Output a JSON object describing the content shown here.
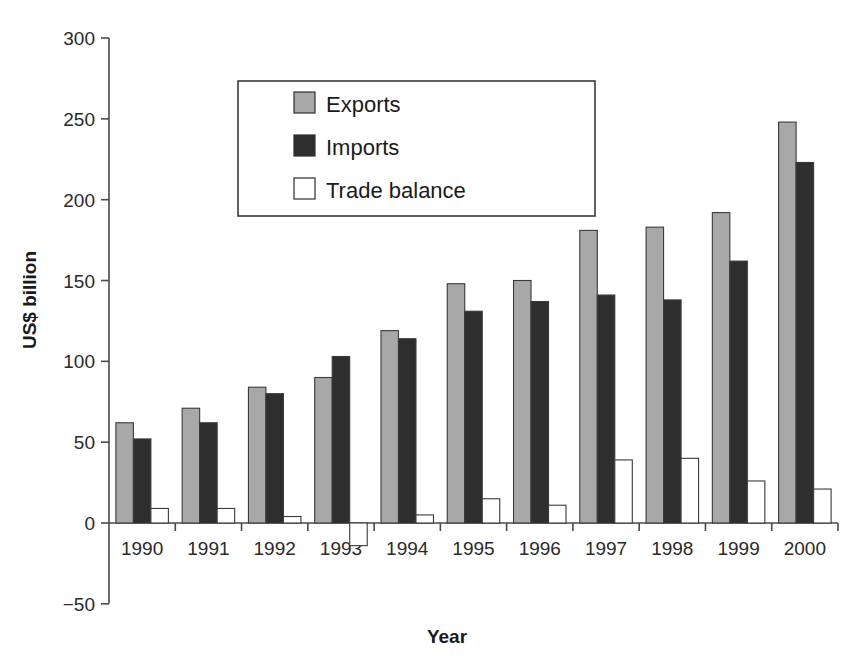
{
  "chart_data": {
    "type": "bar",
    "title": "",
    "xlabel": "Year",
    "ylabel": "US$ billion",
    "categories": [
      "1990",
      "1991",
      "1992",
      "1993",
      "1994",
      "1995",
      "1996",
      "1997",
      "1998",
      "1999",
      "2000"
    ],
    "series": [
      {
        "name": "Exports",
        "color": "#a8a8a8",
        "values": [
          62,
          71,
          84,
          90,
          119,
          148,
          150,
          181,
          183,
          192,
          248
        ]
      },
      {
        "name": "Imports",
        "color": "#2e2e2e",
        "values": [
          52,
          62,
          80,
          103,
          114,
          131,
          137,
          141,
          138,
          162,
          223
        ]
      },
      {
        "name": "Trade balance",
        "color": "#ffffff",
        "values": [
          9,
          9,
          4,
          -14,
          5,
          15,
          11,
          39,
          40,
          26,
          21
        ]
      }
    ],
    "ylim": [
      -50,
      300
    ],
    "yticks": [
      -50,
      0,
      50,
      100,
      150,
      200,
      250,
      300
    ],
    "ytick_labels": [
      "−50",
      "0",
      "50",
      "100",
      "150",
      "200",
      "250",
      "300"
    ],
    "grid": false,
    "legend_position": "upper-left-inside"
  },
  "legend": {
    "entries": [
      {
        "label": "Exports"
      },
      {
        "label": "Imports"
      },
      {
        "label": "Trade balance"
      }
    ]
  },
  "footer": {
    "caption_fragment": ""
  }
}
